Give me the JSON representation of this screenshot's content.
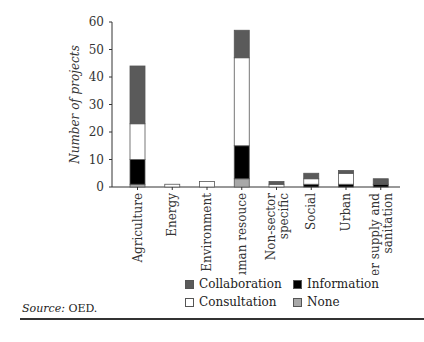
{
  "chart_data": {
    "type": "bar",
    "stacked": true,
    "title": "",
    "xlabel": "",
    "ylabel": "Number of projects",
    "ylim": [
      0,
      60
    ],
    "yticks": [
      0,
      10,
      20,
      30,
      40,
      50,
      60
    ],
    "grid": false,
    "legend_position": "bottom",
    "categories": [
      "Agriculture",
      "Energy",
      "Environment",
      "Human resouce",
      "Non-sector specific",
      "Social",
      "Urban",
      "Water supply and sanitation"
    ],
    "series": [
      {
        "name": "None",
        "color": "#a8a8a8",
        "values": [
          1,
          0,
          0,
          3,
          0,
          0,
          0,
          0
        ]
      },
      {
        "name": "Information",
        "color": "#000000",
        "values": [
          9,
          0,
          0,
          12,
          0,
          1,
          1,
          1
        ]
      },
      {
        "name": "Consultation",
        "color": "#ffffff",
        "values": [
          13,
          1,
          2,
          32,
          1,
          2,
          4,
          0
        ]
      },
      {
        "name": "Collaboration",
        "color": "#5a5a5a",
        "values": [
          21,
          0,
          0,
          10,
          1,
          2,
          1,
          2
        ]
      }
    ]
  },
  "legend": {
    "items": [
      {
        "label": "Collaboration",
        "color": "#5a5a5a"
      },
      {
        "label": "Information",
        "color": "#000000"
      },
      {
        "label": "Consultation",
        "color": "#ffffff"
      },
      {
        "label": "None",
        "color": "#a8a8a8"
      }
    ]
  },
  "source": {
    "label": "Source:",
    "text": "OED."
  }
}
